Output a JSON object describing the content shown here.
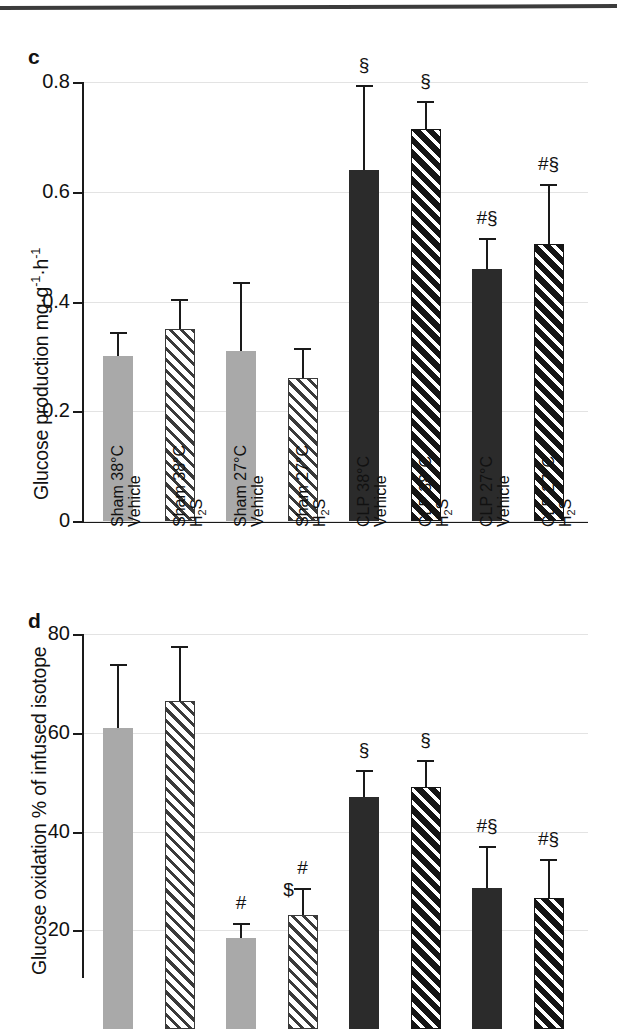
{
  "figure": {
    "top_rule": true,
    "categories": [
      {
        "line1": "Sham 38°C",
        "line2": "Vehicle"
      },
      {
        "line1": "Sham 38°C",
        "line2": "H2S"
      },
      {
        "line1": "Sham 27°C",
        "line2": "Vehicle"
      },
      {
        "line1": "Sham 27°C",
        "line2": "H2S"
      },
      {
        "line1": "CLP 38°C",
        "line2": "Vehicle"
      },
      {
        "line1": "CLP 38°C",
        "line2": "H2S"
      },
      {
        "line1": "CLP 27°C",
        "line2": "Vehicle"
      },
      {
        "line1": "CLP 27°C",
        "line2": "H2S"
      }
    ],
    "colors": {
      "light_bar": "#a9a9a9",
      "dark_bar": "#2b2b2b",
      "gridline": "#e3e3e3",
      "axis": "#1a1a1a"
    }
  },
  "panels": [
    {
      "letter": "c",
      "ylabel_prefix": "Glucose production mg·g",
      "ylabel_sup1": "-1",
      "ylabel_mid": "·h",
      "ylabel_sup2": "-1",
      "ticks": [
        "0.8",
        "0.6",
        "0.4",
        "0.2",
        "0"
      ]
    },
    {
      "letter": "d",
      "ylabel_full": "Glucose oxidation % of infused isotope",
      "ticks": [
        "80",
        "60",
        "40",
        "20"
      ]
    }
  ],
  "chart_data": [
    {
      "type": "bar",
      "panel": "c",
      "title": "",
      "xlabel": "",
      "ylabel": "Glucose production mg·g-1·h-1",
      "ylim": [
        0,
        0.8
      ],
      "yticks": [
        0,
        0.2,
        0.4,
        0.6,
        0.8
      ],
      "grid": true,
      "legend": "none",
      "categories": [
        "Sham 38°C Vehicle",
        "Sham 38°C H2S",
        "Sham 27°C Vehicle",
        "Sham 27°C H2S",
        "CLP 38°C Vehicle",
        "CLP 38°C H2S",
        "CLP 27°C Vehicle",
        "CLP 27°C H2S"
      ],
      "values": [
        0.3,
        0.35,
        0.31,
        0.26,
        0.64,
        0.715,
        0.46,
        0.505
      ],
      "err_upper": [
        0.345,
        0.405,
        0.435,
        0.315,
        0.795,
        0.765,
        0.515,
        0.615
      ],
      "bar_styles": [
        "light-solid",
        "light-hatch",
        "light-solid",
        "light-hatch",
        "dark-solid",
        "dark-hatch",
        "dark-solid",
        "dark-hatch"
      ],
      "annotations": [
        "",
        "",
        "",
        "",
        "§",
        "§",
        "#§",
        "#§"
      ]
    },
    {
      "type": "bar",
      "panel": "d",
      "title": "",
      "xlabel": "",
      "ylabel": "Glucose oxidation % of infused isotope",
      "ylim": [
        0,
        80
      ],
      "yticks": [
        20,
        40,
        60,
        80
      ],
      "grid": true,
      "legend": "none",
      "categories": [
        "Sham 38°C Vehicle",
        "Sham 38°C H2S",
        "Sham 27°C Vehicle",
        "Sham 27°C H2S",
        "CLP 38°C Vehicle",
        "CLP 38°C H2S",
        "CLP 27°C Vehicle",
        "CLP 27°C H2S"
      ],
      "values": [
        61.0,
        66.5,
        18.5,
        23.0,
        47.0,
        49.0,
        28.5,
        26.5
      ],
      "err_upper": [
        74.0,
        77.5,
        21.5,
        28.5,
        52.5,
        54.5,
        37.0,
        34.5
      ],
      "bar_styles": [
        "light-solid",
        "light-hatch",
        "light-solid",
        "light-hatch",
        "dark-solid",
        "dark-hatch",
        "dark-solid",
        "dark-hatch"
      ],
      "annotations": [
        "",
        "",
        "#",
        "#",
        "§",
        "§",
        "#§",
        "#§"
      ],
      "annotations_2": [
        "",
        "",
        "",
        "$",
        "",
        "",
        "",
        ""
      ]
    }
  ]
}
